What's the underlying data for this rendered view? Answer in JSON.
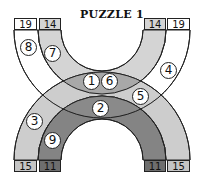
{
  "puzzle": {
    "title": "PUZZLE 1",
    "colors": {
      "top_outer_band": "#ffffff",
      "top_inner_band": "#d4d4d4",
      "bottom_outer_band": "#c4c4c4",
      "bottom_inner_band": "#6e6e6e",
      "overlap_light": "#a8a8a8",
      "overlap_dark": "#8a8a8a",
      "outline": "#222222"
    },
    "end_boxes": {
      "top_left_outer": "19",
      "top_left_inner": "14",
      "top_right_inner": "14",
      "top_right_outer": "19",
      "bottom_left_outer": "15",
      "bottom_left_inner": "11",
      "bottom_right_inner": "11",
      "bottom_right_outer": "15"
    },
    "cells": [
      {
        "label": "1",
        "x": 83,
        "y": 73
      },
      {
        "label": "6",
        "x": 101,
        "y": 73
      },
      {
        "label": "2",
        "x": 92,
        "y": 100
      },
      {
        "label": "3",
        "x": 26,
        "y": 113
      },
      {
        "label": "4",
        "x": 160,
        "y": 62
      },
      {
        "label": "5",
        "x": 132,
        "y": 88
      },
      {
        "label": "7",
        "x": 44,
        "y": 45
      },
      {
        "label": "8",
        "x": 20,
        "y": 39
      },
      {
        "label": "9",
        "x": 44,
        "y": 132
      }
    ]
  }
}
